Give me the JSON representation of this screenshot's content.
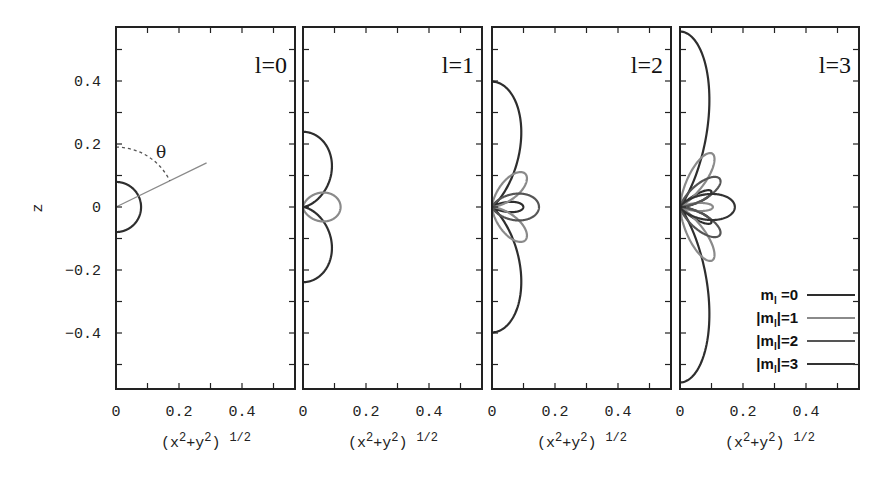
{
  "chart_data": {
    "type": "line",
    "ylabel": "z",
    "xlabel": "(x^2+y^2)^1/2",
    "xlim": [
      0,
      0.568
    ],
    "ylim": [
      -0.578,
      0.571
    ],
    "x_ticks": [
      "0",
      "0.2",
      "0.4"
    ],
    "y_ticks": [
      "0.4",
      "0.2",
      "0",
      "−0.2",
      "−0.4"
    ],
    "y_tick_values": [
      0.4,
      0.2,
      0,
      -0.2,
      -0.4
    ],
    "x_tick_values": [
      0,
      0.2,
      0.4
    ],
    "minor_tick_step": 0.1,
    "grid": false,
    "legend_position": "lower right of last panel",
    "panels": [
      {
        "title": "l=0",
        "l": 0,
        "series_m": [
          0
        ],
        "annotation": {
          "symbol": "θ",
          "angle_deg": 64,
          "ray_length": 0.32,
          "arc_radius": 0.19
        }
      },
      {
        "title": "l=1",
        "l": 1,
        "series_m": [
          0,
          1
        ]
      },
      {
        "title": "l=2",
        "l": 2,
        "series_m": [
          0,
          1,
          2
        ]
      },
      {
        "title": "l=3",
        "l": 3,
        "series_m": [
          0,
          1,
          2,
          3
        ]
      }
    ],
    "series": [
      {
        "name": "m_l =0",
        "m": 0,
        "color": "#2e2e2e"
      },
      {
        "name": "|m_l|=1",
        "m": 1,
        "color": "#8a8a8a"
      },
      {
        "name": "|m_l|=2",
        "m": 2,
        "color": "#555555"
      },
      {
        "name": "|m_l|=3",
        "m": 3,
        "color": "#333333"
      }
    ],
    "peak_values": {
      "l0_m0": 0.0796,
      "l1_m0": 0.239,
      "l1_m1": 0.119,
      "l2_m0": 0.398,
      "l2_m1": 0.149,
      "l2_m2": 0.149,
      "l3_m0": 0.557,
      "l3_m1": 0.175,
      "l3_m2": 0.164,
      "l3_m3": 0.174
    }
  },
  "legend": {
    "items": [
      {
        "prefix": "",
        "m": "m",
        "sub": "l",
        "suffix": " =0",
        "close_bar": false
      },
      {
        "prefix": "|",
        "m": "m",
        "sub": "l",
        "suffix": "|=1",
        "close_bar": true
      },
      {
        "prefix": "|",
        "m": "m",
        "sub": "l",
        "suffix": "|=2",
        "close_bar": true
      },
      {
        "prefix": "|",
        "m": "m",
        "sub": "l",
        "suffix": "|=3",
        "close_bar": true
      }
    ]
  },
  "labels": {
    "z_axis": "z",
    "x_axis_base": "(x",
    "x_axis_sup1": "2",
    "x_axis_mid": "+y",
    "x_axis_sup2": "2",
    "x_axis_close": ")",
    "x_axis_exp": "1/2"
  }
}
